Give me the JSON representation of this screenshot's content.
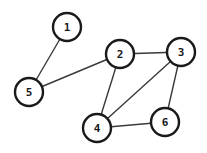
{
  "diagram": {
    "type": "undirected-graph",
    "background_color": "#ffffff",
    "node_fill_color": "#ffffff",
    "node_stroke_color": "#1a1a1a",
    "edge_color": "#3a3a3a",
    "node_radius": 14,
    "canvas": {
      "width": 207,
      "height": 153
    },
    "nodes": [
      {
        "id": "1",
        "label": "1",
        "x": 67,
        "y": 27
      },
      {
        "id": "2",
        "label": "2",
        "x": 120,
        "y": 54
      },
      {
        "id": "3",
        "label": "3",
        "x": 181,
        "y": 52
      },
      {
        "id": "4",
        "label": "4",
        "x": 97,
        "y": 128
      },
      {
        "id": "5",
        "label": "5",
        "x": 29,
        "y": 92
      },
      {
        "id": "6",
        "label": "6",
        "x": 165,
        "y": 122
      }
    ],
    "edges": [
      {
        "from": "1",
        "to": "5"
      },
      {
        "from": "5",
        "to": "2"
      },
      {
        "from": "2",
        "to": "3"
      },
      {
        "from": "2",
        "to": "4"
      },
      {
        "from": "3",
        "to": "4"
      },
      {
        "from": "3",
        "to": "6"
      },
      {
        "from": "4",
        "to": "6"
      }
    ]
  }
}
